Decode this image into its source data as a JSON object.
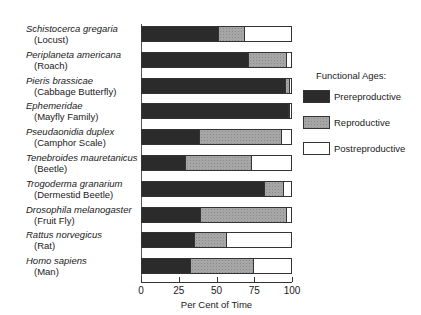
{
  "chart_data": {
    "type": "bar",
    "orientation": "horizontal",
    "stacked": true,
    "title": "",
    "xlabel": "Per Cent of Time",
    "ylabel": "",
    "xlim": [
      0,
      100
    ],
    "xticks": [
      0,
      25,
      50,
      75,
      100
    ],
    "grid": false,
    "legend_title": "Functional Ages:",
    "legend_position": "right",
    "categories": [
      {
        "scientific": "Schistocerca gregaria",
        "common": "(Locust)"
      },
      {
        "scientific": "Periplaneta americana",
        "common": "(Roach)"
      },
      {
        "scientific": "Pieris brassicae",
        "common": "(Cabbage Butterfly)"
      },
      {
        "scientific": "Ephemeridae",
        "common": "(Mayfly Family)"
      },
      {
        "scientific": "Pseudaonidia duplex",
        "common": "(Camphor Scale)"
      },
      {
        "scientific": "Tenebroides mauretanicus",
        "common": "(Beetle)"
      },
      {
        "scientific": "Trogoderma granarium",
        "common": "(Dermestid Beetle)"
      },
      {
        "scientific": "Drosophila melanogaster",
        "common": "(Fruit Fly)"
      },
      {
        "scientific": "Rattus norvegicus",
        "common": "(Rat)"
      },
      {
        "scientific": "Homo sapiens",
        "common": "(Man)"
      }
    ],
    "series": [
      {
        "name": "Prereproductive",
        "color": "#2b2b2b",
        "values": [
          51,
          71,
          96,
          98,
          38,
          29,
          82,
          39,
          35,
          32
        ]
      },
      {
        "name": "Reproductive",
        "color": "#a6a6a6",
        "values": [
          18,
          26,
          3,
          1,
          56,
          45,
          13,
          58,
          22,
          43
        ]
      },
      {
        "name": "Postreproductive",
        "color": "#ffffff",
        "values": [
          31,
          3,
          1,
          1,
          6,
          26,
          5,
          3,
          43,
          25
        ]
      }
    ]
  }
}
